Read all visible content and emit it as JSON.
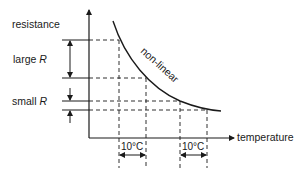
{
  "diagram": {
    "type": "resistance-temperature characteristic",
    "y_axis_label": "resistance",
    "x_axis_label": "temperature",
    "curve_label": "non-linear",
    "large_r": {
      "prefix": "large ",
      "symbol": "R"
    },
    "small_r": {
      "prefix": "small ",
      "symbol": "R"
    },
    "interval_left": "10°C",
    "interval_right": "10°C",
    "colors": {
      "ink": "#1a1a1a",
      "background": "#ffffff"
    }
  }
}
